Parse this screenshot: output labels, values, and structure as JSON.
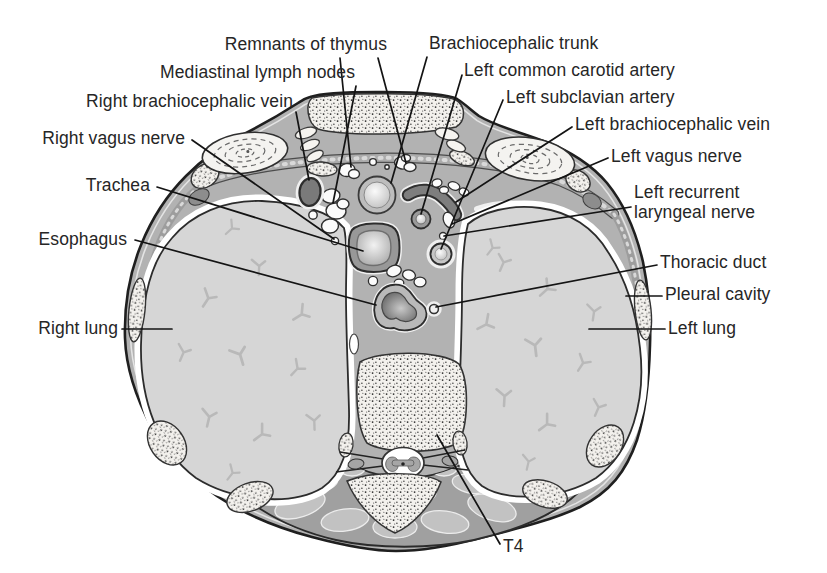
{
  "figure": {
    "kind": "thorax transverse section diagram",
    "labels": {
      "remnants_of_thymus": "Remnants of thymus",
      "mediastinal_lymph_nodes": "Mediastinal lymph nodes",
      "right_brachiocephalic_vein": "Right brachiocephalic vein",
      "right_vagus_nerve": "Right vagus nerve",
      "trachea": "Trachea",
      "esophagus": "Esophagus",
      "right_lung": "Right lung",
      "brachiocephalic_trunk": "Brachiocephalic trunk",
      "left_common_carotid_artery": "Left common carotid artery",
      "left_subclavian_artery": "Left subclavian artery",
      "left_brachiocephalic_vein": "Left brachiocephalic vein",
      "left_vagus_nerve": "Left vagus nerve",
      "left_recurrent_laryngeal_nerve": "Left recurrent laryngeal nerve",
      "thoracic_duct": "Thoracic duct",
      "pleural_cavity": "Pleural cavity",
      "left_lung": "Left lung",
      "t4": "T4"
    },
    "colors": {
      "background": "#ffffff",
      "ink": "#1c1c1c",
      "label_text": "#262626",
      "mediastinum_gray": "#b2b2b2",
      "lung_gray": "#d6d6d6",
      "muscle_gray": "#a2a2a2",
      "muscle_lobule_gray": "#c2c2c2",
      "bone_stipple_base": "#f3f1ed",
      "vein_dark_gray": "#7a7a7a",
      "vessel_wall_gray": "#9a9a9a",
      "leader_line": "#141414"
    }
  }
}
